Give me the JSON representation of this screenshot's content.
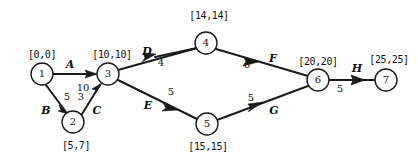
{
  "diagram": {
    "stroke_color": "#1a1a1a",
    "background_color": "#ffffff",
    "nodes": [
      {
        "id": "1",
        "label": "1",
        "times": "[0,0]",
        "cx": 42,
        "cy": 74,
        "r": 11,
        "label_x": 42,
        "label_y": 55
      },
      {
        "id": "2",
        "label": "2",
        "times": "[5,7]",
        "cx": 73,
        "cy": 122,
        "r": 11,
        "label_x": 76,
        "label_y": 146
      },
      {
        "id": "3",
        "label": "3",
        "times": "[10,10]",
        "cx": 108,
        "cy": 74,
        "r": 11,
        "label_x": 112,
        "label_y": 55
      },
      {
        "id": "4",
        "label": "4",
        "times": "[14,14]",
        "cx": 206,
        "cy": 43,
        "r": 11,
        "label_x": 209,
        "label_y": 16
      },
      {
        "id": "5",
        "label": "5",
        "times": "[15,15]",
        "cx": 207,
        "cy": 124,
        "r": 11,
        "label_x": 208,
        "label_y": 147
      },
      {
        "id": "6",
        "label": "6",
        "times": "[20,20]",
        "cx": 318,
        "cy": 80,
        "r": 11,
        "label_x": 318,
        "label_y": 62
      },
      {
        "id": "7",
        "label": "7",
        "times": "[25,25]",
        "cx": 386,
        "cy": 80,
        "r": 11,
        "label_x": 389,
        "label_y": 60
      }
    ],
    "edges": [
      {
        "id": "A",
        "name": "A",
        "duration": "10",
        "from": "1",
        "to": "3",
        "name_x": 70,
        "name_y": 64,
        "dur_x": 83,
        "dur_y": 88
      },
      {
        "id": "B",
        "name": "B",
        "duration": "5",
        "from": "1",
        "to": "2",
        "name_x": 46,
        "name_y": 110,
        "dur_x": 67,
        "dur_y": 97
      },
      {
        "id": "C",
        "name": "C",
        "duration": "3",
        "from": "2",
        "to": "3",
        "name_x": 97,
        "name_y": 110,
        "dur_x": 81,
        "dur_y": 97
      },
      {
        "id": "D",
        "name": "D",
        "duration": "4",
        "from": "3",
        "to": "4",
        "name_x": 147,
        "name_y": 51,
        "dur_x": 161,
        "dur_y": 63
      },
      {
        "id": "E",
        "name": "E",
        "duration": "5",
        "from": "3",
        "to": "5",
        "name_x": 148,
        "name_y": 105,
        "dur_x": 171,
        "dur_y": 92
      },
      {
        "id": "F",
        "name": "F",
        "duration": "6",
        "from": "4",
        "to": "6",
        "name_x": 273,
        "name_y": 58,
        "dur_x": 247,
        "dur_y": 65
      },
      {
        "id": "G",
        "name": "G",
        "duration": "5",
        "from": "5",
        "to": "6",
        "name_x": 274,
        "name_y": 110,
        "dur_x": 251,
        "dur_y": 98
      },
      {
        "id": "H",
        "name": "H",
        "duration": "5",
        "from": "6",
        "to": "7",
        "name_x": 357,
        "name_y": 68,
        "dur_x": 340,
        "dur_y": 89
      }
    ]
  }
}
